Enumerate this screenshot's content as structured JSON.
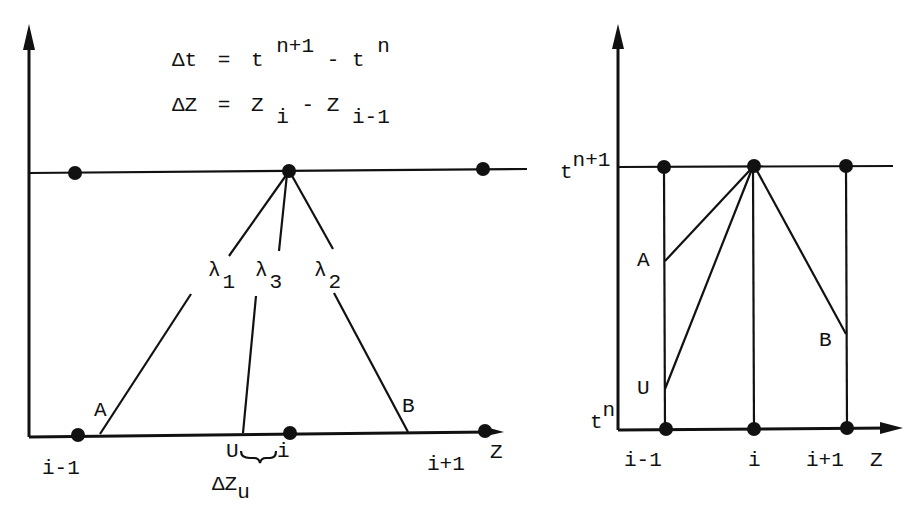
{
  "left_panel": {
    "equations": {
      "dt": {
        "lhs": "Δt",
        "eq": "=",
        "t1": "t",
        "sup1": "n+1",
        "minus": "-",
        "t2": "t",
        "sup2": "n"
      },
      "dz": {
        "lhs": "ΔZ",
        "eq": "=",
        "z1": "Z",
        "sub1": "i",
        "minus": "-",
        "z2": "Z",
        "sub2": "i-1"
      }
    },
    "characteristics": [
      {
        "symbol": "λ",
        "index": "1"
      },
      {
        "symbol": "λ",
        "index": "3"
      },
      {
        "symbol": "λ",
        "index": "2"
      }
    ],
    "points": {
      "a": "A",
      "b": "B",
      "u": "U"
    },
    "x_labels": {
      "left": "i-1",
      "center": "i",
      "right": "i+1",
      "axis": "Z"
    },
    "delta_zu": {
      "symbol": "ΔZ",
      "sub": "u"
    }
  },
  "right_panel": {
    "y_labels": {
      "top": {
        "base": "t",
        "sup": "n+1"
      },
      "bottom": {
        "base": "t",
        "sup": "n"
      }
    },
    "points": {
      "a": "A",
      "b": "B",
      "u": "U"
    },
    "x_labels": {
      "left": "i-1",
      "center": "i",
      "right": "i+1",
      "axis": "Z"
    }
  },
  "colors": {
    "ink": "#111111",
    "background": "#ffffff"
  }
}
